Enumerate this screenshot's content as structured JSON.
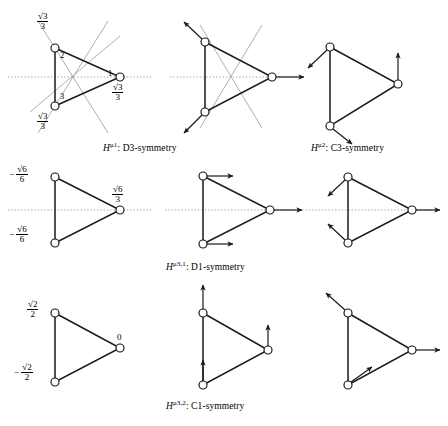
{
  "figure": {
    "type": "diagram",
    "captions": [
      {
        "id": "cap1",
        "symbol": "H",
        "superscript": "μ1",
        "text": ": D3-symmetry",
        "full": "Hμ1 : D3-symmetry",
        "group": "D3"
      },
      {
        "id": "cap2",
        "symbol": "H",
        "superscript": "μ2",
        "text": ": C3-symmetry",
        "full": "Hμ2 : C3-symmetry",
        "group": "C3"
      },
      {
        "id": "cap3",
        "symbol": "H",
        "superscript": "μ3,1",
        "text": ": D1-symmetry",
        "full": "Hμ3,1 : D1-symmetry",
        "group": "D1"
      },
      {
        "id": "cap4",
        "symbol": "H",
        "superscript": "μ3,2",
        "text": ": C1-symmetry",
        "full": "Hμ3,2 : C1-symmetry",
        "group": "C1"
      }
    ],
    "node_indices": {
      "top": "2",
      "right": "1",
      "bottom": "3"
    },
    "row1_values": {
      "top": {
        "sign": "",
        "num": "√3",
        "den": "3"
      },
      "right": {
        "sign": "",
        "num": "√3",
        "den": "3"
      },
      "bottom": {
        "sign": "",
        "num": "√3",
        "den": "3"
      }
    },
    "row2_values": {
      "top": {
        "sign": "−",
        "num": "√6",
        "den": "6"
      },
      "right": {
        "sign": "",
        "num": "√6",
        "den": "3"
      },
      "bottom": {
        "sign": "−",
        "num": "√6",
        "den": "6"
      }
    },
    "row3_values": {
      "top": {
        "sign": "",
        "num": "√2",
        "den": "2"
      },
      "right": {
        "sign": "",
        "num": "0",
        "den": ""
      },
      "bottom": {
        "sign": "−",
        "num": "√2",
        "den": "2"
      }
    },
    "panels": [
      {
        "id": "p11",
        "row": 1,
        "col": 1,
        "mirrors": true,
        "axis": true,
        "arrows": [],
        "labels": "row1_values",
        "indices": true
      },
      {
        "id": "p12",
        "row": 1,
        "col": 2,
        "mirrors": true,
        "axis": true,
        "arrows": [
          "up-left",
          "right",
          "down-left"
        ],
        "labels": null,
        "indices": false
      },
      {
        "id": "p13",
        "row": 1,
        "col": 3,
        "mirrors": false,
        "axis": false,
        "arrows": [
          "down-left",
          "up",
          "down-right"
        ],
        "labels": null,
        "indices": false
      },
      {
        "id": "p21",
        "row": 2,
        "col": 1,
        "mirrors": false,
        "axis": true,
        "arrows": [],
        "labels": "row2_values",
        "indices": false
      },
      {
        "id": "p22",
        "row": 2,
        "col": 2,
        "mirrors": false,
        "axis": true,
        "arrows": [
          "right",
          "right",
          "right"
        ],
        "labels": null,
        "indices": false
      },
      {
        "id": "p23",
        "row": 2,
        "col": 3,
        "mirrors": false,
        "axis": true,
        "arrows": [
          "down-left",
          "right",
          "up-left"
        ],
        "labels": null,
        "indices": false
      },
      {
        "id": "p31",
        "row": 3,
        "col": 1,
        "mirrors": false,
        "axis": false,
        "arrows": [],
        "labels": "row3_values",
        "indices": false
      },
      {
        "id": "p32",
        "row": 3,
        "col": 2,
        "mirrors": false,
        "axis": false,
        "arrows": [
          "up",
          "up",
          "up"
        ],
        "labels": null,
        "indices": false
      },
      {
        "id": "p33",
        "row": 3,
        "col": 3,
        "mirrors": false,
        "axis": false,
        "arrows": [
          "up-left",
          "right",
          "up-right"
        ],
        "labels": null,
        "indices": false
      }
    ],
    "colors": {
      "line": "#1a1a1a",
      "mirror": "#8a8a8a",
      "axis": "#909090",
      "node_fill": "#ffffff",
      "background": "#ffffff"
    }
  }
}
